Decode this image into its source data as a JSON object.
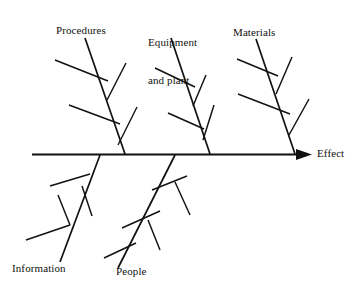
{
  "diagram": {
    "type": "fishbone",
    "alt_name": "Ishikawa cause-and-effect diagram",
    "effect_label": "Effect",
    "categories": [
      {
        "id": "procedures",
        "label": "Procedures",
        "position": "above",
        "spine_x": 125
      },
      {
        "id": "equipment",
        "label": "Equipment\nand plant",
        "position": "above",
        "spine_x": 210
      },
      {
        "id": "materials",
        "label": "Materials",
        "position": "above",
        "spine_x": 295
      },
      {
        "id": "information",
        "label": "Information",
        "position": "below",
        "spine_x": 100
      },
      {
        "id": "people",
        "label": "People",
        "position": "below",
        "spine_x": 175
      }
    ],
    "spine": {
      "x_start": 32,
      "x_end": 310,
      "y": 154,
      "arrow": "right-arrowhead"
    },
    "stroke_color": "#111111",
    "background_color": "#ffffff"
  },
  "labels": {
    "procedures": "Procedures",
    "equipment_line1": "Equipment",
    "equipment_line2": "and plant",
    "materials": "Materials",
    "effect": "Effect",
    "information": "Information",
    "people": "People"
  }
}
